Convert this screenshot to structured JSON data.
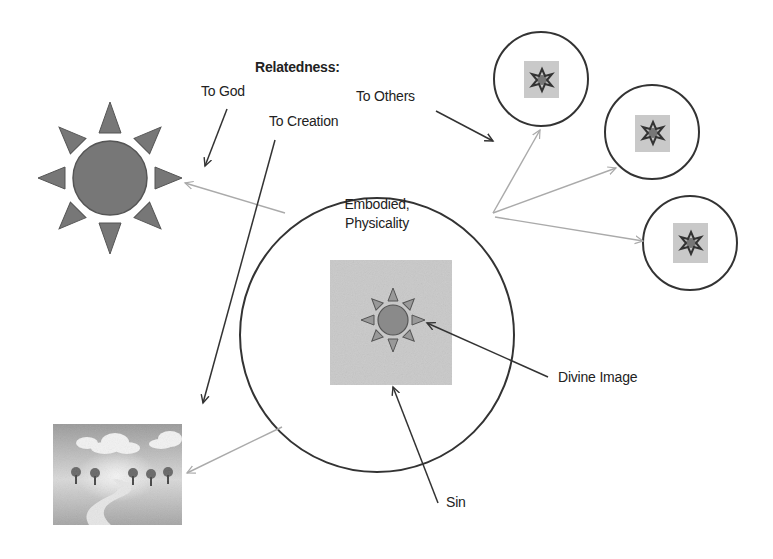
{
  "diagram": {
    "heading": "Relatedness:",
    "relations": {
      "to_god": "To God",
      "to_creation": "To Creation",
      "to_others": "To Others"
    },
    "center_circle": {
      "line1": "Embodied,",
      "line2": "Physicality"
    },
    "callouts": {
      "divine_image": "Divine Image",
      "sin": "Sin"
    },
    "icons": {
      "god": "sun-icon",
      "creation": "landscape-icon",
      "others": [
        "person-circle-icon",
        "person-circle-icon",
        "person-circle-icon"
      ],
      "self_core": "small-sun-icon"
    },
    "colors": {
      "line": "#333333",
      "light_arrow": "#aaaaaa",
      "sun_fill": "#777777",
      "gray_square": "#c8c8c8",
      "inner_sun_fill": "#8a8a8a"
    }
  }
}
